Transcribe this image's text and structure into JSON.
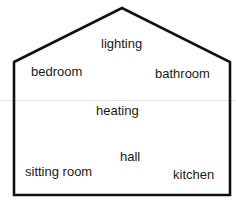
{
  "diagram": {
    "type": "house-outline",
    "stroke_color": "#111111",
    "background": "#ffffff",
    "outline_points": [
      [
        14,
        62
      ],
      [
        122,
        8
      ],
      [
        230,
        62
      ],
      [
        230,
        195
      ],
      [
        14,
        195
      ]
    ],
    "rooms": [
      {
        "id": "lighting",
        "label": "lighting",
        "x": 101,
        "y": 36
      },
      {
        "id": "bedroom",
        "label": "bedroom",
        "x": 31,
        "y": 64
      },
      {
        "id": "bathroom",
        "label": "bathroom",
        "x": 155,
        "y": 66
      },
      {
        "id": "heating",
        "label": "heating",
        "x": 96,
        "y": 103
      },
      {
        "id": "hall",
        "label": "hall",
        "x": 120,
        "y": 149
      },
      {
        "id": "sitting-room",
        "label": "sitting room",
        "x": 25,
        "y": 164
      },
      {
        "id": "kitchen",
        "label": "kitchen",
        "x": 173,
        "y": 167
      }
    ]
  }
}
